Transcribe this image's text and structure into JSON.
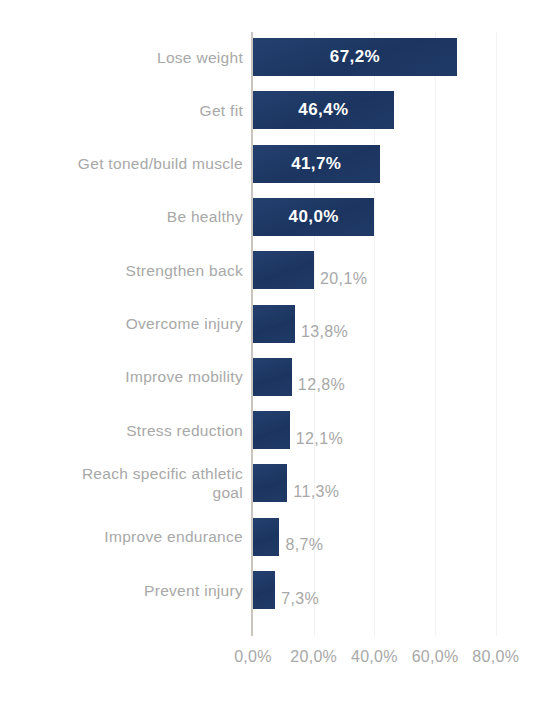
{
  "chart_data": {
    "type": "bar",
    "orientation": "horizontal",
    "title": "",
    "subtitle": "",
    "xlabel": "",
    "ylabel": "",
    "xlim": [
      0,
      80
    ],
    "grid": true,
    "legend": null,
    "legend_position": "none",
    "decimal_separator": ",",
    "value_suffix": "%",
    "bar_color": "#1f3864",
    "label_color": "#a8a8a8",
    "inside_label_color": "#ffffff",
    "axis_line_color": "#c9c4bd",
    "gridline_color": "#f2f2f2",
    "xticks": [
      "0,0%",
      "20,0%",
      "40,0%",
      "60,0%",
      "80,0%"
    ],
    "xtick_values": [
      0,
      20,
      40,
      60,
      80
    ],
    "categories": [
      "Lose weight",
      "Get fit",
      "Get toned/build muscle",
      "Be healthy",
      "Strengthen back",
      "Overcome injury",
      "Improve mobility",
      "Stress reduction",
      "Reach specific athletic\ngoal",
      "Improve endurance",
      "Prevent injury"
    ],
    "values": [
      67.2,
      46.4,
      41.7,
      40.0,
      20.1,
      13.8,
      12.8,
      12.1,
      11.3,
      8.7,
      7.3
    ],
    "data_labels": [
      "67,2%",
      "46,4%",
      "41,7%",
      "40,0%",
      "20,1%",
      "13,8%",
      "12,8%",
      "12,1%",
      "11,3%",
      "8,7%",
      "7,3%"
    ],
    "label_placement": [
      "inside",
      "inside",
      "inside",
      "inside",
      "outside",
      "outside",
      "outside",
      "outside",
      "outside",
      "outside",
      "outside"
    ]
  }
}
